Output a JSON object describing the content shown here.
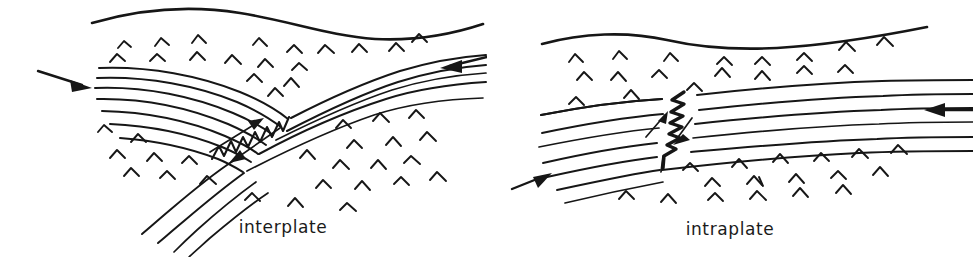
{
  "figure": {
    "background_color": "#ffffff",
    "ink_color": "#161616",
    "style": "hand-drawn line diagram",
    "panel_count": 2
  },
  "panels": [
    {
      "id": "interplate",
      "caption": "interplate",
      "description": "Convergent plate boundary: a layered plate from the left abuts a layered slab descending from the right; a zigzag fault marks the plate interface. Stippled chevron marks fill the surrounding mantle.",
      "arrows": [
        {
          "name": "left-convergence-arrow",
          "direction": "right",
          "label": ""
        },
        {
          "name": "right-convergence-arrow",
          "direction": "left",
          "label": ""
        }
      ],
      "fault": {
        "name": "interplate-fault",
        "style": "zigzag",
        "orientation": "diagonal",
        "slip_arrows": 2
      }
    },
    {
      "id": "intraplate",
      "caption": "intraplate",
      "description": "A single continuous layered plate containing an internal near-vertical zigzag fault with opposing slip arrows. Chevron marks fill the mantle above and below the plate.",
      "arrows": [
        {
          "name": "left-compression-arrow",
          "direction": "up-right",
          "label": ""
        },
        {
          "name": "right-compression-arrow",
          "direction": "left",
          "label": ""
        }
      ],
      "fault": {
        "name": "intraplate-fault",
        "style": "zigzag",
        "orientation": "near-vertical",
        "slip_arrows": 2
      }
    }
  ],
  "captions": {
    "left": "interplate",
    "right": "intraplate"
  },
  "icons": {
    "chevron": "mantle-chevron-mark",
    "arrow": "convergence-arrow-icon",
    "zigzag": "fault-zigzag-icon"
  }
}
